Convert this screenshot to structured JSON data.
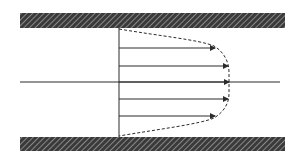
{
  "diagram": {
    "type": "velocity-profile",
    "colors": {
      "background": "#ffffff",
      "wall_fill": "#3a3a3a",
      "wall_hatch": "#bdbdbd",
      "line": "#2b2b2b"
    },
    "walls": [
      {
        "name": "top-wall",
        "x": 20,
        "y": 13,
        "width": 265,
        "height": 15
      },
      {
        "name": "bottom-wall",
        "x": 20,
        "y": 137,
        "width": 265,
        "height": 14
      }
    ],
    "reference_line": {
      "x": 119,
      "y1": 28,
      "y2": 137
    },
    "centerline": {
      "y": 82,
      "x1": 20,
      "x2": 280
    },
    "arrows": [
      {
        "y": 48,
        "x_tip": 215
      },
      {
        "y": 66,
        "x_tip": 228
      },
      {
        "y": 82,
        "x_tip": 229
      },
      {
        "y": 99,
        "x_tip": 228
      },
      {
        "y": 116,
        "x_tip": 215
      }
    ],
    "profile_curve": "M119,29 C160,36 200,40 214,46 C224,52 229,62 229,72 L229,94 C229,103 224,112 214,118 C200,124 160,129 119,136"
  }
}
